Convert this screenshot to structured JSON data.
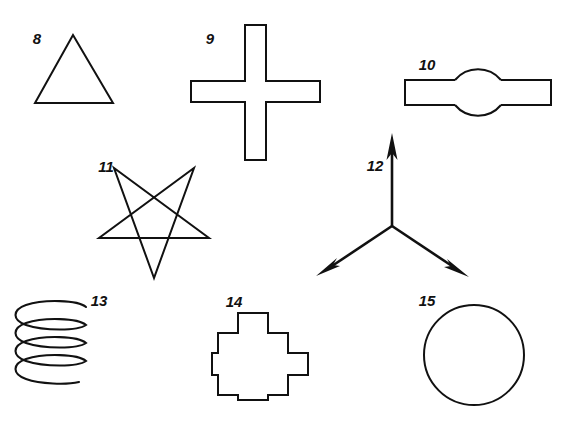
{
  "sheet": {
    "title": "Geometric figures plate 8-15",
    "background_color": "#ffffff",
    "ink_color": "#111111",
    "width": 573,
    "height": 425
  },
  "figures": [
    {
      "number": "8",
      "name": "triangle",
      "description": "Equilateral triangle outline",
      "label_x": 37,
      "label_y": 44
    },
    {
      "number": "9",
      "name": "greek-cross",
      "description": "Plain greek cross / plus-sign outline",
      "label_x": 208,
      "label_y": 44
    },
    {
      "number": "10",
      "name": "circle-with-bar",
      "description": "Circle with a horizontal rectangular bar through it",
      "label_x": 421,
      "label_y": 70
    },
    {
      "number": "11",
      "name": "pentagram-star",
      "description": "Five pointed star drawn as continuous pentagram, point down",
      "label_x": 103,
      "label_y": 172
    },
    {
      "number": "12",
      "name": "three-way-arrow",
      "description": "Three arrows radiating from a common centre, one up, two down-left and down-right",
      "label_x": 368,
      "label_y": 171
    },
    {
      "number": "13",
      "name": "helix-spring",
      "description": "Coil spring / helix drawn as four overlapping ellipse loops",
      "label_x": 91,
      "label_y": 306
    },
    {
      "number": "14",
      "name": "stepped-cross",
      "description": "Cross with stepped notched corners",
      "label_x": 231,
      "label_y": 307
    },
    {
      "number": "15",
      "name": "circle",
      "description": "Plain circle outline",
      "label_x": 421,
      "label_y": 306
    }
  ]
}
